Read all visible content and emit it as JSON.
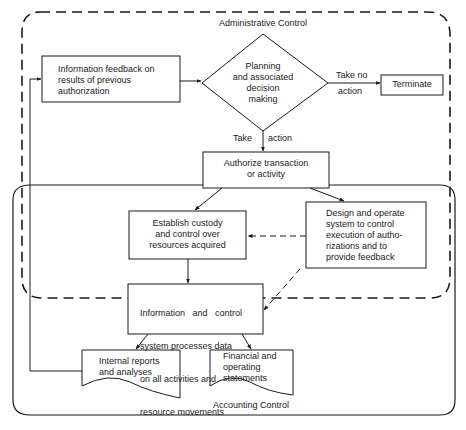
{
  "regions": {
    "administrative": {
      "label": "Administrative Control",
      "style": "dashed"
    },
    "accounting": {
      "label": "Accounting Control",
      "style": "solid"
    }
  },
  "nodes": {
    "feedback": {
      "type": "process",
      "lines": [
        "Information feedback on",
        "results of previous",
        "authorization"
      ]
    },
    "planning": {
      "type": "decision",
      "lines": [
        "Planning",
        "and associated",
        "decision",
        "making"
      ]
    },
    "terminate": {
      "type": "terminal",
      "lines": [
        "Terminate"
      ]
    },
    "authorize": {
      "type": "process",
      "lines": [
        "Authorize transaction",
        "or activity"
      ]
    },
    "custody": {
      "type": "process",
      "lines": [
        "Establish custody",
        "and control over",
        "resources acquired"
      ]
    },
    "design": {
      "type": "process",
      "lines": [
        "Design and operate",
        "system to control",
        "execution of autho-",
        "rizations and to",
        "provide feedback"
      ]
    },
    "info_system": {
      "type": "process",
      "lines": [
        "Information   and   control",
        "system processes data",
        "on all activities and",
        "resource movements"
      ]
    },
    "internal_reports": {
      "type": "document",
      "lines": [
        "Internal reports",
        "and analyses"
      ]
    },
    "financial_statements": {
      "type": "document",
      "lines": [
        "Financial and",
        "operating",
        "statements"
      ]
    }
  },
  "edges": {
    "no_action": {
      "from": "planning",
      "to": "terminate",
      "label_top": "Take no",
      "label_bottom": "action"
    },
    "take_action": {
      "from": "planning",
      "to": "authorize",
      "label_left": "Take",
      "label_right": "action"
    },
    "feedback_to_planning": {
      "from": "feedback",
      "to": "planning"
    },
    "authorize_to_custody": {
      "from": "authorize",
      "to": "custody"
    },
    "authorize_to_design": {
      "from": "authorize",
      "to": "design"
    },
    "design_to_custody": {
      "from": "design",
      "to": "custody",
      "style": "dashed"
    },
    "design_to_info": {
      "from": "design",
      "to": "info_system",
      "style": "dashed"
    },
    "custody_to_info": {
      "from": "custody",
      "to": "info_system"
    },
    "info_to_internal": {
      "from": "info_system",
      "to": "internal_reports"
    },
    "info_to_financial": {
      "from": "info_system",
      "to": "financial_statements"
    },
    "internal_to_feedback": {
      "from": "internal_reports",
      "to": "feedback"
    }
  },
  "colors": {
    "stroke": "#1a1a1a",
    "background": "#ffffff"
  }
}
